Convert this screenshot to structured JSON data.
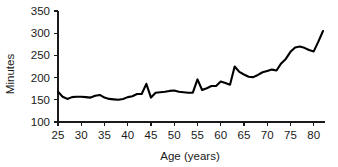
{
  "chart_data": {
    "type": "line",
    "title": "",
    "xlabel": "Age (years)",
    "ylabel": "Minutes",
    "xlim": [
      25,
      82
    ],
    "ylim": [
      100,
      350
    ],
    "xticks": [
      25,
      30,
      35,
      40,
      45,
      50,
      55,
      60,
      65,
      70,
      75,
      80
    ],
    "yticks": [
      100,
      150,
      200,
      250,
      300,
      350
    ],
    "xtick_labels": [
      "25",
      "30",
      "35",
      "40",
      "45",
      "50",
      "55",
      "60",
      "65",
      "70",
      "75",
      "80"
    ],
    "ytick_labels": [
      "100",
      "150",
      "200",
      "250",
      "300",
      "350"
    ],
    "grid": false,
    "legend": false,
    "legend_position": "none",
    "line_color": "#000000",
    "series": [
      {
        "name": "Minutes by age",
        "x": [
          25,
          26,
          27,
          28,
          29,
          30,
          31,
          32,
          33,
          34,
          35,
          36,
          37,
          38,
          39,
          40,
          41,
          42,
          43,
          44,
          45,
          46,
          47,
          48,
          49,
          50,
          51,
          52,
          53,
          54,
          55,
          56,
          57,
          58,
          59,
          60,
          61,
          62,
          63,
          64,
          65,
          66,
          67,
          68,
          69,
          70,
          71,
          72,
          73,
          74,
          75,
          76,
          77,
          78,
          79,
          80,
          81,
          82
        ],
        "values": [
          168,
          157,
          152,
          156,
          157,
          157,
          156,
          155,
          159,
          161,
          155,
          152,
          151,
          150,
          152,
          156,
          158,
          163,
          163,
          186,
          155,
          166,
          167,
          168,
          170,
          171,
          168,
          167,
          166,
          166,
          196,
          172,
          176,
          181,
          181,
          191,
          188,
          184,
          225,
          213,
          207,
          202,
          201,
          206,
          212,
          215,
          218,
          216,
          232,
          242,
          258,
          268,
          270,
          267,
          262,
          259,
          281,
          305
        ]
      }
    ]
  }
}
